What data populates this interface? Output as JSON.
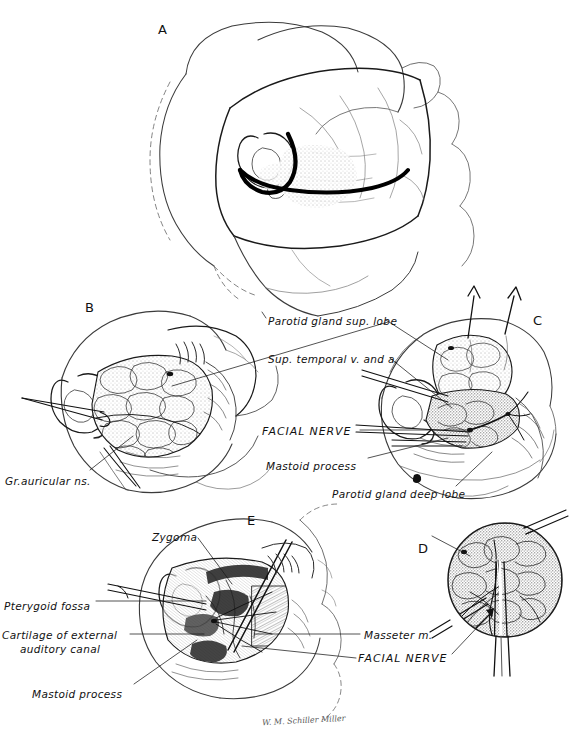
{
  "plate": {
    "width": 573,
    "height": 747,
    "background": "#ffffff",
    "ink": "#111111",
    "subject": "Parotidectomy with facial nerve dissection",
    "signature": "W. M. Schiller Miller"
  },
  "panels": [
    {
      "id": "A",
      "letter": "A",
      "x": 158,
      "y": 22,
      "caption": "Skin incision and superficial anatomy, lateral head view"
    },
    {
      "id": "B",
      "letter": "B",
      "x": 85,
      "y": 300,
      "caption": "Flap elevated, superficial parotid lobe exposed"
    },
    {
      "id": "C",
      "letter": "C",
      "x": 533,
      "y": 313,
      "caption": "Superficial lobe retracted, facial nerve branches displayed"
    },
    {
      "id": "D",
      "letter": "D",
      "x": 418,
      "y": 541,
      "caption": "Circular close-up inset of nerve trunk dissection"
    },
    {
      "id": "E",
      "letter": "E",
      "x": 247,
      "y": 513,
      "caption": "Deep lobe removed, parotid bed and landmarks"
    }
  ],
  "labels": [
    {
      "id": "parotid-sup-lobe",
      "text": "Parotid gland sup. lobe",
      "style": "italic",
      "x": 268,
      "y": 314,
      "leaders": [
        {
          "from": [
            385,
            322
          ],
          "to": [
            448,
            362
          ]
        },
        {
          "from": [
            385,
            322
          ],
          "to": [
            170,
            385
          ]
        }
      ]
    },
    {
      "id": "sup-temporal-v-and-a",
      "text": "Sup. temporal  v. and a.",
      "style": "italic",
      "x": 268,
      "y": 352,
      "leaders": [
        {
          "from": [
            390,
            360
          ],
          "to": [
            455,
            410
          ]
        }
      ]
    },
    {
      "id": "facial-nerve-c",
      "text": "FACIAL NERVE",
      "style": "caps-italic",
      "x": 262,
      "y": 425,
      "leaders": [
        {
          "from": [
            362,
            432
          ],
          "to": [
            470,
            430
          ]
        }
      ]
    },
    {
      "id": "mastoid-process-c",
      "text": "Mastoid process",
      "style": "italic",
      "x": 266,
      "y": 459,
      "leaders": [
        {
          "from": [
            368,
            462
          ],
          "to": [
            450,
            440
          ]
        }
      ]
    },
    {
      "id": "parotid-deep-lobe",
      "text": "Parotid gland deep lobe",
      "style": "italic",
      "x": 332,
      "y": 487,
      "marker_dot": [
        415,
        478
      ],
      "leaders": [
        {
          "from": [
            455,
            487
          ],
          "to": [
            492,
            452
          ]
        }
      ]
    },
    {
      "id": "gr-auricular-ns",
      "text": "Gr.auricular ns.",
      "style": "italic",
      "x": 5,
      "y": 474,
      "leaders": [
        {
          "from": [
            90,
            474
          ],
          "to": [
            134,
            436
          ]
        }
      ]
    },
    {
      "id": "zygoma",
      "text": "Zygoma",
      "style": "italic",
      "x": 152,
      "y": 530,
      "leaders": [
        {
          "from": [
            200,
            540
          ],
          "to": [
            232,
            586
          ]
        }
      ]
    },
    {
      "id": "pterygoid-fossa",
      "text": "Pterygoid fossa",
      "style": "italic",
      "x": 4,
      "y": 599,
      "leaders": [
        {
          "from": [
            96,
            605
          ],
          "to": [
            205,
            605
          ]
        }
      ]
    },
    {
      "id": "cartilage-external-auditory-canal",
      "text": "Cartilage of external",
      "text_line2": "auditory canal",
      "style": "italic",
      "x": 2,
      "y": 632,
      "leaders": [
        {
          "from": [
            128,
            637
          ],
          "to": [
            205,
            637
          ]
        }
      ]
    },
    {
      "id": "mastoid-process-e",
      "text": "Mastoid process",
      "style": "italic",
      "x": 32,
      "y": 687,
      "leaders": [
        {
          "from": [
            132,
            688
          ],
          "to": [
            196,
            640
          ]
        }
      ]
    },
    {
      "id": "masseter-m",
      "text": "Masseter m.",
      "style": "italic",
      "x": 364,
      "y": 632,
      "leaders": [
        {
          "from": [
            360,
            637
          ],
          "to": [
            252,
            637
          ]
        }
      ]
    },
    {
      "id": "facial-nerve-e",
      "text": "FACIAL NERVE",
      "style": "caps-italic",
      "x": 358,
      "y": 657,
      "leaders": [
        {
          "from": [
            356,
            661
          ],
          "to": [
            240,
            648
          ]
        },
        {
          "from": [
            452,
            657
          ],
          "to": [
            492,
            620
          ]
        }
      ]
    }
  ]
}
